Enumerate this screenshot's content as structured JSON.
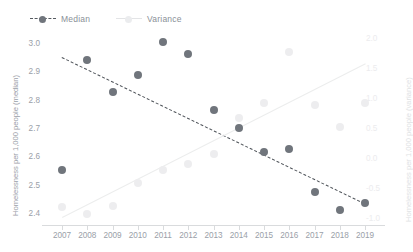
{
  "legend": {
    "items": [
      {
        "label": "Median",
        "color": "#70757c",
        "style": "dashed-line-with-marker"
      },
      {
        "label": "Variance",
        "color": "#ededef",
        "style": "solid-line-with-marker"
      }
    ]
  },
  "axes": {
    "left_title": "Homelessness per 1,000 people (median)",
    "right_title": "Homelessness per 1,000 people (variance)",
    "left_ticks": [
      "3.0",
      "2.9",
      "2.8",
      "2.7",
      "2.6",
      "2.5",
      "2.4"
    ],
    "right_ticks": [
      "2.0",
      "1.5",
      "1.0",
      "0.5",
      "0.0",
      "-0.5",
      "-1.0"
    ],
    "x_ticks": [
      "2007",
      "2008",
      "2009",
      "2010",
      "2011",
      "2012",
      "2013",
      "2014",
      "2015",
      "2016",
      "2017",
      "2018",
      "2019"
    ]
  },
  "chart_data": {
    "type": "scatter",
    "title": "",
    "xlabel": "",
    "ylabel": "Homelessness per 1,000 people (median)",
    "y2label": "Homelessness per 1,000 people (variance)",
    "x": [
      2007,
      2008,
      2009,
      2010,
      2011,
      2012,
      2013,
      2014,
      2015,
      2016,
      2017,
      2018,
      2019
    ],
    "ylim": [
      2.37,
      3.03
    ],
    "y2lim": [
      -1.1,
      2.1
    ],
    "grid": false,
    "legend_position": "top-left",
    "series": [
      {
        "name": "Median",
        "axis": "left",
        "color": "#70757c",
        "marker": "circle",
        "values": [
          2.55,
          2.945,
          2.83,
          2.89,
          3.01,
          2.965,
          2.765,
          2.7,
          2.615,
          2.625,
          2.47,
          2.405,
          2.43
        ],
        "trendline": {
          "style": "dashed",
          "color": "#4e5359",
          "start": [
            2007,
            2.955
          ],
          "end": [
            2019,
            2.43
          ]
        }
      },
      {
        "name": "Variance",
        "axis": "right",
        "color": "#ededef",
        "marker": "circle",
        "values": [
          -0.88,
          -1.0,
          -0.86,
          -0.45,
          -0.23,
          -0.12,
          0.05,
          0.67,
          0.93,
          1.83,
          0.9,
          0.52,
          0.93
        ],
        "trendline": {
          "style": "solid",
          "color": "#eceded",
          "start": [
            2007,
            -1.05
          ],
          "end": [
            2019,
            1.62
          ]
        }
      }
    ]
  }
}
